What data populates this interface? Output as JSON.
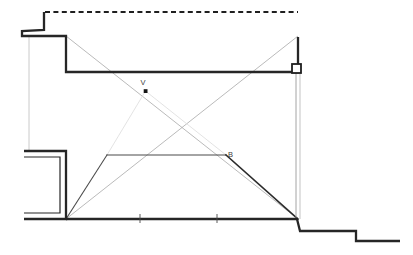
{
  "figure": {
    "kind": "perspective-construction-section-drawing",
    "background_color": "#ffffff",
    "canvas": {
      "width": 413,
      "height": 255
    },
    "colors": {
      "heavy_outline": "#262626",
      "medium_line": "#444444",
      "light_construction": "#b6b6b6",
      "faint_construction": "#d2d2d2",
      "label_text": "#3c3c3c",
      "marker_fill": "#1a1a1a"
    },
    "labels": [
      {
        "id": "vanishing-point",
        "text": "V",
        "x": 145,
        "y": 84
      },
      {
        "id": "point-b",
        "text": "B",
        "x": 226,
        "y": 155
      }
    ],
    "markers": [
      {
        "id": "vanishing-point-dot",
        "shape": "filled-square",
        "x": 145.5,
        "y": 91,
        "size": 3.6
      },
      {
        "id": "hinge-node-square",
        "shape": "open-square",
        "x": 296,
        "y": 68,
        "size": 8
      }
    ],
    "tick_marks": [
      {
        "id": "floor-tick-1",
        "x": 140,
        "y": 219
      },
      {
        "id": "floor-tick-2",
        "x": 217,
        "y": 219
      }
    ],
    "paths": {
      "dashed_ceiling_line": "M 44,11 L 298,11",
      "upper_wall_bracket": "M 44,11 L 44,30 L 22,30 L 22,36 L 66,36 L 66,72 L 298,72 L 298,36",
      "lower_wall_bracket": "M 24,151 L 66,151 L 66,219 L 24,219 L 24,213 L 60,213 L 60,157 L 24,157 Z",
      "left_thin_wall_line": "M 29,36 L 29,151",
      "floor_line": "M 66,219 L 298,219",
      "bottom_right_steps": "M 298,219 L 300,231 L 355,231 L 355,241 L 400,241",
      "right_post_outer": "M 296,72 L 296,219",
      "right_post_inner": "M 300,72 L 300,219",
      "trapezoid_left_rake": "M 66,219 L 107,155",
      "trapezoid_top": "M 107,155 L 226,155",
      "trapezoid_right_rake": "M 226,155 L 298,219",
      "diag_topleft_to_botright": "M 66,36 L 298,219",
      "diag_topright_to_botleft": "M 298,36 L 66,219",
      "faint_v_left": "M 145,91 L 107,155",
      "faint_v_right": "M 145,91 L 226,155"
    }
  }
}
